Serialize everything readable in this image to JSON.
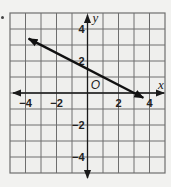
{
  "chart_data": {
    "type": "line",
    "title": "",
    "xlabel": "x",
    "ylabel": "y",
    "origin_label": "O",
    "xlim": [
      -5,
      5
    ],
    "ylim": [
      -5,
      5
    ],
    "grid": true,
    "grid_step": 1,
    "x_tick_labels": [
      {
        "value": -4,
        "label": "−4"
      },
      {
        "value": -2,
        "label": "−2"
      },
      {
        "value": 2,
        "label": "2"
      },
      {
        "value": 4,
        "label": "4"
      }
    ],
    "y_tick_labels": [
      {
        "value": 4,
        "label": "4"
      },
      {
        "value": 2,
        "label": "2"
      },
      {
        "value": -2,
        "label": "−2"
      },
      {
        "value": -4,
        "label": "−4"
      }
    ],
    "series": [
      {
        "name": "line",
        "equation": "y = -0.5x + 1.5",
        "slope": -0.5,
        "y_intercept": 1.5,
        "x_intercept": 3,
        "x": [
          -3.8,
          3.6
        ],
        "y": [
          3.4,
          -0.3
        ],
        "arrow_start": true,
        "arrow_end": true
      }
    ],
    "legend": null
  },
  "colors": {
    "background": "#f2f2f0",
    "grid": "#6e6e6e",
    "axis": "#1a1a1a",
    "line": "#111111"
  }
}
